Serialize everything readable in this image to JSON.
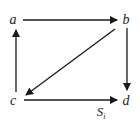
{
  "diagram": {
    "nodes": [
      {
        "id": "a",
        "label": "a",
        "x": 13,
        "y": 20
      },
      {
        "id": "b",
        "label": "b",
        "x": 126,
        "y": 20
      },
      {
        "id": "c",
        "label": "c",
        "x": 13,
        "y": 101
      },
      {
        "id": "d",
        "label": "d",
        "x": 126,
        "y": 101
      }
    ],
    "edges": [
      {
        "from": "a",
        "to": "b"
      },
      {
        "from": "b",
        "to": "d"
      },
      {
        "from": "b",
        "to": "c"
      },
      {
        "from": "c",
        "to": "a"
      },
      {
        "from": "c",
        "to": "d"
      }
    ],
    "caption": {
      "main": "S",
      "subscript": "i"
    },
    "colors": {
      "line": "#1a1a1a",
      "text": "#222222"
    }
  }
}
